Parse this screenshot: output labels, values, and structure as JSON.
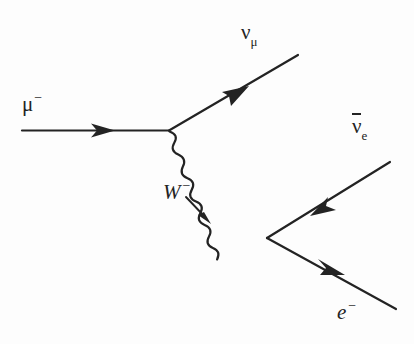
{
  "diagram": {
    "type": "feynman-diagram",
    "process": "mu- -> nu_mu + W-  ;  W- -> e- + anti-nu_e",
    "background_color": "#fdfdfd",
    "line_color": "#232323",
    "labels": {
      "muon": {
        "symbol": "μ",
        "charge": "−"
      },
      "muon_neutrino": {
        "symbol": "ν",
        "subscript": "μ"
      },
      "w_boson": {
        "symbol": "W",
        "charge": "−"
      },
      "electron_antineutrino": {
        "symbol": "ν",
        "subscript": "e",
        "bar": true
      },
      "electron": {
        "symbol": "e",
        "charge": "−"
      }
    },
    "vertices": [
      {
        "name": "upper-vertex",
        "x": 169,
        "y": 130
      },
      {
        "name": "lower-vertex",
        "x": 267,
        "y": 238
      }
    ],
    "lines": [
      {
        "name": "muon-line",
        "style": "straight",
        "from": [
          22,
          130
        ],
        "to": [
          169,
          130
        ],
        "arrow": "forward",
        "arrow_at": 0.62
      },
      {
        "name": "muon-neutrino-line",
        "style": "straight",
        "from": [
          169,
          130
        ],
        "to": [
          298,
          55
        ],
        "arrow": "forward",
        "arrow_at": 0.56
      },
      {
        "name": "w-boson-line",
        "style": "wavy",
        "from": [
          169,
          130
        ],
        "to": [
          267,
          238
        ],
        "arrow": "none"
      },
      {
        "name": "electron-antineutrino-line",
        "style": "straight",
        "from": [
          390,
          162
        ],
        "to": [
          267,
          238
        ],
        "arrow": "backward",
        "arrow_at": 0.52
      },
      {
        "name": "electron-line",
        "style": "straight",
        "from": [
          267,
          238
        ],
        "to": [
          396,
          309
        ],
        "arrow": "forward",
        "arrow_at": 0.56
      }
    ],
    "w_direction_arrow": {
      "name": "w-direction-arrow",
      "from": [
        186,
        197
      ],
      "to": [
        210,
        222
      ]
    }
  }
}
